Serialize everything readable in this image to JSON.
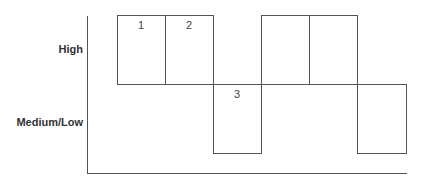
{
  "diagram": {
    "y_labels": {
      "high": "High",
      "medium_low": "Medium/Low"
    },
    "blocks": [
      {
        "index": 1,
        "label": "1",
        "level": "High"
      },
      {
        "index": 2,
        "label": "2",
        "level": "High"
      },
      {
        "index": 3,
        "label": "3",
        "level": "Medium/Low"
      },
      {
        "index": 4,
        "label": "",
        "level": "High"
      },
      {
        "index": 5,
        "label": "",
        "level": "High"
      },
      {
        "index": 6,
        "label": "",
        "level": "Medium/Low"
      }
    ],
    "line_color": "#555555"
  }
}
